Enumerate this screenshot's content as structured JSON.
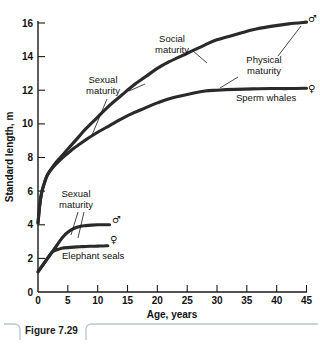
{
  "figure": {
    "caption": "Figure 7.29"
  },
  "chart_data": {
    "type": "line",
    "title": "",
    "xlabel": "Age, years",
    "ylabel": "Standard length, m",
    "xlim": [
      0,
      45
    ],
    "ylim": [
      0,
      16
    ],
    "xticks": [
      0,
      5,
      10,
      15,
      20,
      25,
      30,
      35,
      40,
      45
    ],
    "yticks": [
      0,
      2,
      4,
      6,
      8,
      10,
      12,
      14,
      16
    ],
    "xticklabels": [
      "0",
      "5",
      "10",
      "15",
      "20",
      "25",
      "30",
      "35",
      "40",
      "45"
    ],
    "yticklabels": [
      "0",
      "2",
      "4",
      "6",
      "8",
      "10",
      "12",
      "14",
      "16"
    ],
    "grid": false,
    "legend": "none",
    "series": [
      {
        "name": "Sperm whale male",
        "group": "Sperm whales",
        "sex": "male",
        "sex_symbol": "♂",
        "x": [
          0,
          0.3,
          0.6,
          1,
          1.5,
          2,
          3,
          4,
          5,
          6,
          7,
          8,
          10,
          12,
          14,
          16,
          18,
          20,
          22,
          25,
          28,
          30,
          33,
          36,
          39,
          42,
          45
        ],
        "y": [
          4.1,
          5.2,
          5.9,
          6.4,
          6.9,
          7.2,
          7.7,
          8.1,
          8.5,
          8.9,
          9.3,
          9.7,
          10.4,
          11.1,
          11.7,
          12.3,
          12.8,
          13.3,
          13.7,
          14.2,
          14.7,
          15.0,
          15.3,
          15.6,
          15.8,
          15.95,
          16.05
        ]
      },
      {
        "name": "Sperm whale female",
        "group": "Sperm whales",
        "sex": "female",
        "sex_symbol": "♀",
        "x": [
          0,
          0.3,
          0.6,
          1,
          1.5,
          2,
          3,
          4,
          5,
          6,
          7,
          8,
          10,
          12,
          14,
          16,
          18,
          20,
          22,
          25,
          28,
          30,
          33,
          36,
          39,
          42,
          45
        ],
        "y": [
          4.1,
          5.2,
          5.9,
          6.4,
          6.9,
          7.2,
          7.6,
          7.95,
          8.25,
          8.55,
          8.8,
          9.05,
          9.5,
          9.9,
          10.3,
          10.65,
          10.95,
          11.25,
          11.5,
          11.75,
          11.95,
          12.0,
          12.05,
          12.08,
          12.1,
          12.1,
          12.12
        ]
      },
      {
        "name": "Elephant seal male",
        "group": "Elephant seals",
        "sex": "male",
        "sex_symbol": "♂",
        "x": [
          0,
          0.5,
          1,
          1.5,
          2,
          2.5,
          3,
          3.5,
          4,
          4.5,
          5,
          5.5,
          6,
          7,
          8,
          9,
          10,
          11,
          12
        ],
        "y": [
          1.2,
          1.45,
          1.7,
          1.95,
          2.2,
          2.45,
          2.7,
          2.95,
          3.2,
          3.4,
          3.55,
          3.68,
          3.78,
          3.9,
          3.95,
          3.98,
          4.0,
          4.0,
          4.0
        ]
      },
      {
        "name": "Elephant seal female",
        "group": "Elephant seals",
        "sex": "female",
        "sex_symbol": "♀",
        "x": [
          0,
          0.5,
          1,
          1.5,
          2,
          2.5,
          3,
          3.5,
          4,
          5,
          6,
          7,
          8,
          9,
          10,
          11,
          11.7
        ],
        "y": [
          1.2,
          1.45,
          1.7,
          1.95,
          2.2,
          2.4,
          2.5,
          2.55,
          2.6,
          2.64,
          2.67,
          2.69,
          2.71,
          2.72,
          2.73,
          2.74,
          2.75
        ]
      }
    ],
    "annotations": [
      {
        "id": "social-maturity",
        "text_line1": "Social",
        "text_line2": "maturity",
        "points_to": "Sperm whale male"
      },
      {
        "id": "physical-maturity",
        "text_line1": "Physical",
        "text_line2": "maturity",
        "points_to": "Sperm whale curves endpoints"
      },
      {
        "id": "sexual-maturity-whales",
        "text_line1": "Sexual",
        "text_line2": "maturity",
        "points_to": "Sperm whale curves"
      },
      {
        "id": "sexual-maturity-seals",
        "text_line1": "Sexual",
        "text_line2": "maturity",
        "points_to": "Elephant seal curves"
      },
      {
        "id": "sperm-whales-label",
        "text_line1": "Sperm whales",
        "points_to": "Sperm whale group"
      },
      {
        "id": "elephant-seals-label",
        "text_line1": "Elephant seals",
        "points_to": "Elephant seal group"
      }
    ]
  }
}
